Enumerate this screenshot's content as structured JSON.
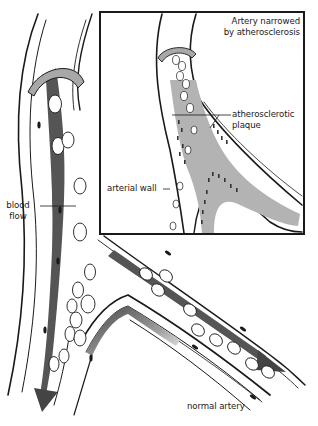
{
  "figure": {
    "type": "medical-illustration",
    "colors": {
      "line": "#1a1a1a",
      "blood_stream": "#555555",
      "plaque": "#b3b3b3",
      "band": "#a8a8a8",
      "background": "#ffffff"
    }
  },
  "labels": {
    "inset_title_line1": "Artery narrowed",
    "inset_title_line2": "by atherosclerosis",
    "plaque_line1": "atherosclerotic",
    "plaque_line2": "plaque",
    "arterial_wall": "arterial wall",
    "blood_flow_line1": "blood",
    "blood_flow_line2": "flow",
    "normal_artery": "normal artery"
  }
}
